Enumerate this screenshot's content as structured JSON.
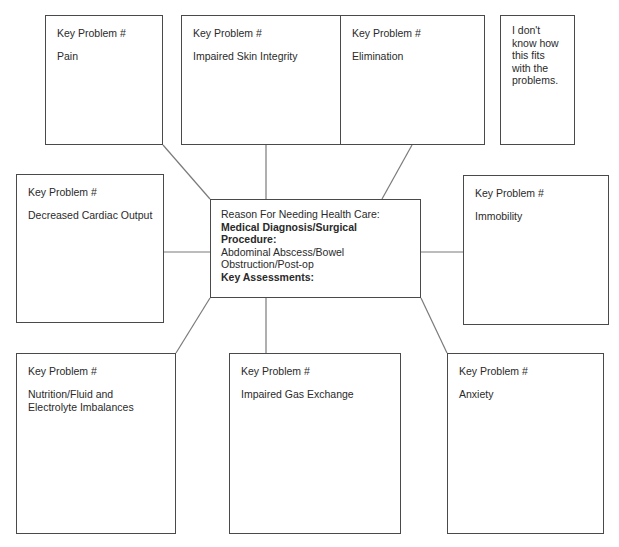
{
  "diagram": {
    "type": "concept-map",
    "center": {
      "reason_label": "Reason For Needing Health Care:",
      "diagnosis_label": "Medical Diagnosis/Surgical Procedure:",
      "diagnosis_line1": "Abdominal Abscess/Bowel",
      "diagnosis_line2": "Obstruction/Post-op",
      "assessments_label": "Key Assessments:"
    },
    "problems": [
      {
        "header": "Key Problem #",
        "label": "Pain"
      },
      {
        "header": "Key Problem #",
        "label": "Impaired Skin Integrity"
      },
      {
        "header": "Key Problem #",
        "label": "Elimination"
      },
      {
        "header": "Key Problem #",
        "label": "Decreased Cardiac Output"
      },
      {
        "header": "Key Problem #",
        "label": "Immobility"
      },
      {
        "header": "Key Problem #",
        "label": "Nutrition/Fluid and\nElectrolyte Imbalances"
      },
      {
        "header": "Key Problem #",
        "label": "Impaired Gas Exchange"
      },
      {
        "header": "Key Problem #",
        "label": "Anxiety"
      }
    ],
    "unlinked_note": "I don't\nknow how\nthis fits\nwith the\nproblems."
  }
}
